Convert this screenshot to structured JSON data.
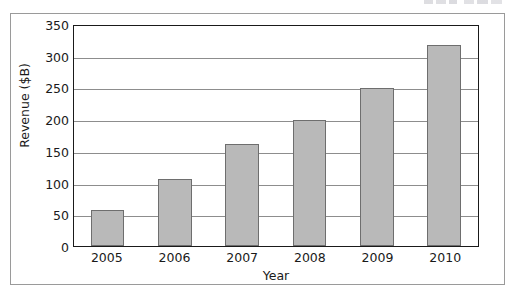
{
  "figure": {
    "background_color": "#ffffff",
    "frame_color": "#9a9a9a",
    "axis_color": "#1a1a1a",
    "gridline_color": "#8d8d8d",
    "bar_fill_color": "#b9b9b9",
    "bar_edge_color": "#6e6e6e"
  },
  "chart_data": {
    "type": "bar",
    "title": "",
    "xlabel": "Year",
    "ylabel": "Revenue ($B)",
    "categories": [
      "2005",
      "2006",
      "2007",
      "2008",
      "2009",
      "2010"
    ],
    "values": [
      57,
      106,
      162,
      200,
      251,
      320
    ],
    "series": [
      {
        "name": "Revenue",
        "values": [
          57,
          106,
          162,
          200,
          251,
          320
        ]
      }
    ],
    "ylim": [
      0,
      350
    ],
    "yticks": [
      0,
      50,
      100,
      150,
      200,
      250,
      300,
      350
    ],
    "ytick_labels": [
      "0",
      "50",
      "100",
      "150",
      "200",
      "250",
      "300",
      "350"
    ],
    "xtick_labels": [
      "2005",
      "2006",
      "2007",
      "2008",
      "2009",
      "2010"
    ],
    "grid": true,
    "grid_axis": "y",
    "legend": false,
    "legend_position": "none",
    "annotations": []
  }
}
